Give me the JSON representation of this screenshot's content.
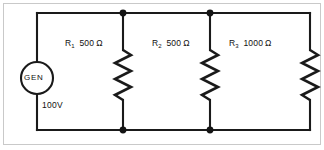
{
  "diagram": {
    "background_color": "#ffffff",
    "line_color": "#1a1a1a",
    "frame_color": "#c9c9c9"
  },
  "source": {
    "name": "generator",
    "symbol_label": "GEN",
    "value_label": "100V",
    "voltage": 100,
    "unit": "V"
  },
  "resistors": [
    {
      "ref": "R",
      "index": "1",
      "value": "500",
      "unit": "Ω",
      "resistance_ohms": 500
    },
    {
      "ref": "R",
      "index": "2",
      "value": "500",
      "unit": "Ω",
      "resistance_ohms": 500
    },
    {
      "ref": "R",
      "index": "3",
      "value": "1000",
      "unit": "Ω",
      "resistance_ohms": 1000
    }
  ],
  "nodes": {
    "count": 4,
    "description": "junction dots on top and bottom rails"
  }
}
